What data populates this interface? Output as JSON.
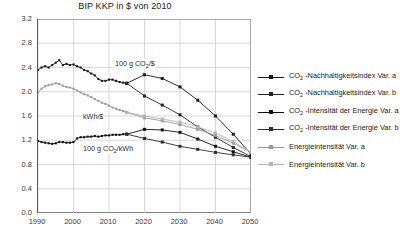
{
  "chart_data": {
    "type": "line",
    "title": "BIP KKP in $ von 2010",
    "xlabel": "",
    "ylabel": "",
    "xlim": [
      1990,
      2050
    ],
    "ylim": [
      0.0,
      3.2
    ],
    "ytick_step": 0.4,
    "yticks": [
      "3.2",
      "2.8",
      "2.4",
      "2.0",
      "1.6",
      "1.2",
      "0.8",
      "0.4",
      "0.0"
    ],
    "xticks": [
      "1990",
      "2000",
      "2010",
      "2020",
      "2030",
      "2040",
      "2050"
    ],
    "grid": true,
    "legend_position": "right",
    "annotations": [
      {
        "text": "100 g CO2/$",
        "html": "100 g CO<sub>2</sub>/$",
        "x": 2019,
        "y": 2.45
      },
      {
        "text": "kWh/$",
        "html": "kWh/$",
        "x": 2010,
        "y": 1.58
      },
      {
        "text": "100 g CO2/kWh",
        "html": "100 g CO<sub>2</sub>/kWh",
        "x": 2010,
        "y": 1.06
      }
    ],
    "series": [
      {
        "name": "CO2 -Nachhaltigkeitsindex Var. a",
        "label_html": "CO<sub>2</sub> -Nachhaltigkeitsindex Var. a",
        "color": "#1a1a1a",
        "marker": "square",
        "x": [
          1990,
          1991,
          1992,
          1993,
          1994,
          1995,
          1996,
          1997,
          1998,
          1999,
          2000,
          2001,
          2002,
          2003,
          2004,
          2005,
          2006,
          2007,
          2008,
          2009,
          2010,
          2011,
          2012,
          2013,
          2014,
          2015,
          2020,
          2025,
          2030,
          2035,
          2040,
          2045,
          2050
        ],
        "y": [
          2.36,
          2.4,
          2.42,
          2.4,
          2.44,
          2.48,
          2.52,
          2.44,
          2.46,
          2.44,
          2.45,
          2.42,
          2.4,
          2.36,
          2.34,
          2.3,
          2.27,
          2.21,
          2.18,
          2.18,
          2.2,
          2.2,
          2.18,
          2.16,
          2.15,
          2.14,
          2.28,
          2.22,
          2.08,
          1.86,
          1.6,
          1.3,
          0.97
        ]
      },
      {
        "name": "CO2 -Nachhaltigkeitsindex Var. b",
        "label_html": "CO<sub>2</sub> -Nachhaltigkeitsindex Var. b",
        "color": "#262626",
        "marker": "square",
        "x": [
          2015,
          2020,
          2025,
          2030,
          2035,
          2040,
          2045,
          2050
        ],
        "y": [
          2.14,
          1.93,
          1.78,
          1.62,
          1.42,
          1.25,
          1.08,
          0.93
        ]
      },
      {
        "name": "CO2 -Intensitaet der Energie Var. a",
        "label_html": "CO<sub>2</sub> -Intensität der Energie Var. a",
        "color": "#111111",
        "marker": "square",
        "x": [
          1990,
          1991,
          1992,
          1993,
          1994,
          1995,
          1996,
          1997,
          1998,
          1999,
          2000,
          2001,
          2002,
          2003,
          2004,
          2005,
          2006,
          2007,
          2008,
          2009,
          2010,
          2011,
          2012,
          2013,
          2014,
          2015,
          2020,
          2025,
          2030,
          2035,
          2040,
          2045,
          2050
        ],
        "y": [
          1.19,
          1.17,
          1.16,
          1.15,
          1.14,
          1.15,
          1.17,
          1.17,
          1.16,
          1.16,
          1.17,
          1.23,
          1.25,
          1.25,
          1.26,
          1.26,
          1.27,
          1.26,
          1.27,
          1.28,
          1.28,
          1.29,
          1.29,
          1.29,
          1.3,
          1.3,
          1.38,
          1.37,
          1.33,
          1.22,
          1.1,
          1.01,
          0.92
        ]
      },
      {
        "name": "CO2 -Intensitaet der Energie Var. b",
        "label_html": "CO<sub>2</sub> -Intensität der Energie Var. b",
        "color": "#2e2e2e",
        "marker": "square",
        "x": [
          2015,
          2020,
          2025,
          2030,
          2035,
          2040,
          2045,
          2050
        ],
        "y": [
          1.3,
          1.23,
          1.17,
          1.1,
          1.05,
          1.0,
          0.96,
          0.92
        ]
      },
      {
        "name": "Energieintensitaet Var. a",
        "label_html": "Energieintensität Var. a",
        "color": "#9b9b9b",
        "marker": "square",
        "x": [
          1990,
          1991,
          1992,
          1993,
          1994,
          1995,
          1996,
          1997,
          1998,
          1999,
          2000,
          2001,
          2002,
          2003,
          2004,
          2005,
          2006,
          2007,
          2008,
          2009,
          2010,
          2011,
          2012,
          2013,
          2014,
          2015,
          2020,
          2025,
          2030,
          2035,
          2040,
          2045,
          2050
        ],
        "y": [
          1.99,
          2.05,
          2.09,
          2.11,
          2.12,
          2.14,
          2.13,
          2.1,
          2.08,
          2.07,
          2.05,
          2.02,
          1.99,
          1.96,
          1.94,
          1.91,
          1.88,
          1.85,
          1.82,
          1.8,
          1.77,
          1.74,
          1.72,
          1.7,
          1.68,
          1.66,
          1.57,
          1.52,
          1.46,
          1.38,
          1.28,
          1.15,
          1.0
        ]
      },
      {
        "name": "Energieintensitaet Var. b",
        "label_html": "Energieintensität Var. b",
        "color": "#b4b4b4",
        "marker": "square",
        "x": [
          2015,
          2020,
          2025,
          2030,
          2035,
          2040,
          2045,
          2050
        ],
        "y": [
          1.66,
          1.6,
          1.55,
          1.5,
          1.42,
          1.32,
          1.18,
          1.0
        ]
      }
    ]
  },
  "legend": {
    "items": [
      {
        "label_html": "CO<sub>2</sub> -Nachhaltigkeitsindex Var. a",
        "color": "#1a1a1a",
        "gap_before": false
      },
      {
        "label_html": "CO<sub>2</sub> -Nachhaltigkeitsindex Var. b",
        "color": "#262626",
        "gap_before": false
      },
      {
        "label_html": "CO<sub>2</sub> -Intensität der Energie Var. a",
        "color": "#111111",
        "gap_before": true
      },
      {
        "label_html": "CO<sub>2</sub> -Intensität der Energie Var. b",
        "color": "#2e2e2e",
        "gap_before": false
      },
      {
        "label_html": "Energieintensität Var. a",
        "color": "#9b9b9b",
        "gap_before": true
      },
      {
        "label_html": "Energieintensität Var. b",
        "color": "#b4b4b4",
        "gap_before": false
      }
    ]
  }
}
